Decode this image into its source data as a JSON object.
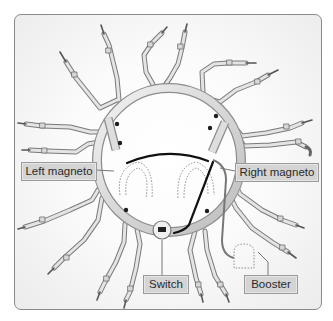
{
  "diagram": {
    "labels": {
      "left_magneto": "Left magneto",
      "right_magneto": "Right magneto",
      "switch": "Switch",
      "booster": "Booster"
    },
    "components": [
      {
        "id": "ignition-harness-ring",
        "description": "Circular ignition harness manifold"
      },
      {
        "id": "spark-plug-leads",
        "count": 18,
        "description": "Shielded leads radiating to spark plugs"
      },
      {
        "id": "left-magneto",
        "style": "dotted outline"
      },
      {
        "id": "right-magneto",
        "style": "dotted outline"
      },
      {
        "id": "switch",
        "description": "Ignition switch at bottom center"
      },
      {
        "id": "booster",
        "style": "dotted outline",
        "description": "Booster coil connected to right magneto"
      }
    ],
    "colors": {
      "label_bg": "#d4d4d4",
      "label_border": "#9a9a9a",
      "label_text": "#2a2a2a",
      "harness": "#cfcfcf",
      "wire": "#111111",
      "frame_border": "#8a8a8a"
    }
  }
}
